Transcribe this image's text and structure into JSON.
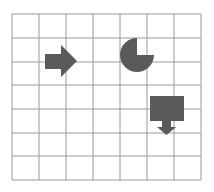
{
  "grid": {
    "columns": 7,
    "rows": 7,
    "line_color": "#9a9a9a",
    "background": "#ffffff"
  },
  "shapes": [
    {
      "name": "right-arrow",
      "color": "#5a5a5a",
      "cell": {
        "col": 1,
        "row": 1
      }
    },
    {
      "name": "pacman-quarter-cut-circle",
      "color": "#5a5a5a",
      "missing_quadrant": "top-right",
      "cell": {
        "col": 4,
        "row": 1
      }
    },
    {
      "name": "rectangle-with-down-arrow",
      "color": "#5a5a5a",
      "cell": {
        "col": 5,
        "row": 3
      }
    }
  ]
}
